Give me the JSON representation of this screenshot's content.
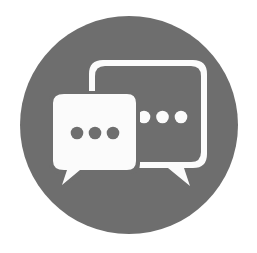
{
  "icon": {
    "name": "chat-bubbles-icon",
    "description": "Two overlapping speech bubbles with ellipsis dots inside a circle",
    "colors": {
      "background": "#ffffff",
      "circle": "#6e6e6e",
      "foreground": "#fbfbfb",
      "dots_on_light": "#6e6e6e",
      "dots_on_dark": "#fbfbfb"
    },
    "left_bubble": {
      "style": "filled",
      "dots": 3
    },
    "right_bubble": {
      "style": "outline",
      "dots": 3
    }
  }
}
